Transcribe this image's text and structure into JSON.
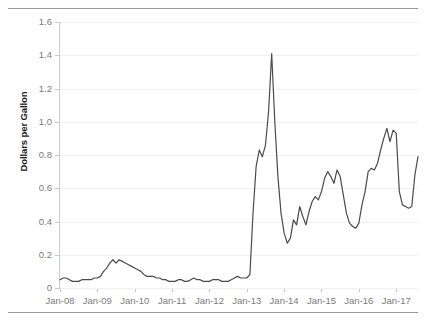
{
  "figure": {
    "top_rule": "horizontal-rule",
    "bottom_rule": "horizontal-rule",
    "line_color": "#4a4a4a",
    "grid_color": "#f1f1f1",
    "axis_color": "#c9c9c9",
    "tick_label_color": "#7b7b7b",
    "axis_title_color": "#1b1b1b"
  },
  "chart_data": {
    "type": "line",
    "title": "",
    "xlabel": "",
    "ylabel": "Dollars per Gallon",
    "ylim": [
      0,
      1.6
    ],
    "yticks": [
      0,
      0.2,
      0.4,
      0.6,
      0.8,
      1.0,
      1.2,
      1.4,
      1.6
    ],
    "ytick_labels": [
      "0",
      "0.2",
      "0.4",
      "0.6",
      "0.8",
      "1.0",
      "1.2",
      "1.4",
      "1.6"
    ],
    "xticks": [
      "Jan-08",
      "Jan-09",
      "Jan-10",
      "Jan-11",
      "Jan-12",
      "Jan-13",
      "Jan-14",
      "Jan-15",
      "Jan-16",
      "Jan-17"
    ],
    "xlim": [
      "Jan-08",
      "Jul-17"
    ],
    "grid": true,
    "legend": "none",
    "series": [
      {
        "name": "Dollars per Gallon",
        "color": "#4a4a4a",
        "x": [
          "Jan-08",
          "Feb-08",
          "Mar-08",
          "Apr-08",
          "May-08",
          "Jun-08",
          "Jul-08",
          "Aug-08",
          "Sep-08",
          "Oct-08",
          "Nov-08",
          "Dec-08",
          "Jan-09",
          "Feb-09",
          "Mar-09",
          "Apr-09",
          "May-09",
          "Jun-09",
          "Jul-09",
          "Aug-09",
          "Sep-09",
          "Oct-09",
          "Nov-09",
          "Dec-09",
          "Jan-10",
          "Feb-10",
          "Mar-10",
          "Apr-10",
          "May-10",
          "Jun-10",
          "Jul-10",
          "Aug-10",
          "Sep-10",
          "Oct-10",
          "Nov-10",
          "Dec-10",
          "Jan-11",
          "Feb-11",
          "Mar-11",
          "Apr-11",
          "May-11",
          "Jun-11",
          "Jul-11",
          "Aug-11",
          "Sep-11",
          "Oct-11",
          "Nov-11",
          "Dec-11",
          "Jan-12",
          "Feb-12",
          "Mar-12",
          "Apr-12",
          "May-12",
          "Jun-12",
          "Jul-12",
          "Aug-12",
          "Sep-12",
          "Oct-12",
          "Nov-12",
          "Dec-12",
          "Jan-13",
          "Feb-13",
          "Mar-13",
          "Apr-13",
          "May-13",
          "Jun-13",
          "Jul-13",
          "Aug-13",
          "Sep-13",
          "Oct-13",
          "Nov-13",
          "Dec-13",
          "Jan-14",
          "Feb-14",
          "Mar-14",
          "Apr-14",
          "May-14",
          "Jun-14",
          "Jul-14",
          "Aug-14",
          "Sep-14",
          "Oct-14",
          "Nov-14",
          "Dec-14",
          "Jan-15",
          "Feb-15",
          "Mar-15",
          "Apr-15",
          "May-15",
          "Jun-15",
          "Jul-15",
          "Aug-15",
          "Sep-15",
          "Oct-15",
          "Nov-15",
          "Dec-15",
          "Jan-16",
          "Feb-16",
          "Mar-16",
          "Apr-16",
          "May-16",
          "Jun-16",
          "Jul-16",
          "Aug-16",
          "Sep-16",
          "Oct-16",
          "Nov-16",
          "Dec-16",
          "Jan-17",
          "Feb-17",
          "Mar-17",
          "Apr-17",
          "May-17",
          "Jun-17",
          "Jul-17",
          "Aug-17"
        ],
        "values": [
          0.05,
          0.06,
          0.06,
          0.05,
          0.04,
          0.04,
          0.04,
          0.05,
          0.05,
          0.05,
          0.05,
          0.06,
          0.06,
          0.07,
          0.1,
          0.12,
          0.15,
          0.17,
          0.15,
          0.17,
          0.16,
          0.15,
          0.14,
          0.13,
          0.12,
          0.11,
          0.1,
          0.08,
          0.07,
          0.07,
          0.07,
          0.06,
          0.06,
          0.05,
          0.05,
          0.04,
          0.04,
          0.04,
          0.05,
          0.05,
          0.04,
          0.04,
          0.05,
          0.06,
          0.05,
          0.05,
          0.04,
          0.04,
          0.04,
          0.05,
          0.05,
          0.05,
          0.04,
          0.04,
          0.04,
          0.05,
          0.06,
          0.07,
          0.06,
          0.06,
          0.06,
          0.08,
          0.45,
          0.73,
          0.83,
          0.79,
          0.86,
          1.06,
          1.41,
          1.0,
          0.67,
          0.45,
          0.33,
          0.27,
          0.3,
          0.41,
          0.38,
          0.49,
          0.43,
          0.38,
          0.46,
          0.52,
          0.55,
          0.53,
          0.58,
          0.66,
          0.7,
          0.67,
          0.63,
          0.71,
          0.67,
          0.56,
          0.45,
          0.39,
          0.37,
          0.36,
          0.39,
          0.5,
          0.58,
          0.7,
          0.72,
          0.71,
          0.75,
          0.83,
          0.9,
          0.96,
          0.88,
          0.95,
          0.93,
          0.58,
          0.5,
          0.49,
          0.48,
          0.49,
          0.68,
          0.79
        ]
      }
    ]
  }
}
